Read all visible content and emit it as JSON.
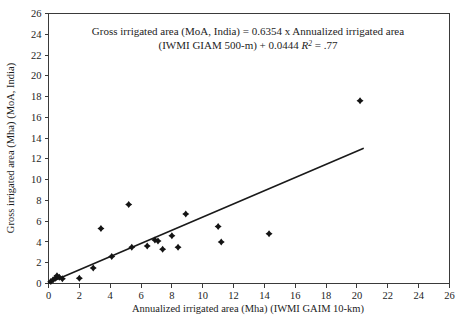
{
  "chart_data": {
    "type": "scatter",
    "title": "",
    "xlabel": "Annualized irrigated area (Mha) (IWMI GAIM 10-km)",
    "ylabel": "Gross irrigated area (Mha) (MoA, India)",
    "xlim": [
      0,
      26
    ],
    "ylim": [
      0,
      26
    ],
    "xticks": [
      0,
      2,
      4,
      6,
      8,
      10,
      12,
      14,
      16,
      18,
      20,
      22,
      24,
      26
    ],
    "yticks": [
      0,
      2,
      4,
      6,
      8,
      10,
      12,
      14,
      16,
      18,
      20,
      22,
      24,
      26
    ],
    "grid": false,
    "legend": "none",
    "annotation_line1": "Gross irrigated area (MoA, India) = 0.6354 x Annualized irrigated area",
    "annotation_line2_a": "(IWMI GIAM 500-m) + 0.0444 ",
    "annotation_line2_r": "R",
    "annotation_line2_sup": "2",
    "annotation_line2_b": " = .77",
    "point_color": "#141414",
    "line_color": "#1a1a1a",
    "axis_color": "#3a3a3a",
    "series": [
      {
        "name": "Gross vs annualized irrigated area",
        "points": [
          [
            0.15,
            0.2
          ],
          [
            0.3,
            0.35
          ],
          [
            0.45,
            0.5
          ],
          [
            0.55,
            0.75
          ],
          [
            0.7,
            0.6
          ],
          [
            0.9,
            0.45
          ],
          [
            2.0,
            0.5
          ],
          [
            2.9,
            1.5
          ],
          [
            3.4,
            5.3
          ],
          [
            4.1,
            2.6
          ],
          [
            5.2,
            7.6
          ],
          [
            5.4,
            3.5
          ],
          [
            6.4,
            3.6
          ],
          [
            6.9,
            4.2
          ],
          [
            7.1,
            4.1
          ],
          [
            7.4,
            3.3
          ],
          [
            8.0,
            4.6
          ],
          [
            8.4,
            3.5
          ],
          [
            8.9,
            6.7
          ],
          [
            11.0,
            5.5
          ],
          [
            11.2,
            4.0
          ],
          [
            14.3,
            4.8
          ],
          [
            20.2,
            17.6
          ]
        ]
      }
    ],
    "fit_line": {
      "slope": 0.6354,
      "intercept": 0.0444,
      "r_squared": 0.77,
      "x_start": 0.0,
      "x_end": 20.4
    }
  }
}
